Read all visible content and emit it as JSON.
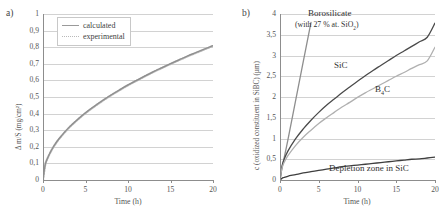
{
  "figure": {
    "panel_a_tag": "a)",
    "panel_b_tag": "b)"
  },
  "panel_a": {
    "xlabel": "Time (h)",
    "ylabel": "Δ m/S (mg/cm²)",
    "yticks": [
      "1",
      "0,9",
      "0,8",
      "0,7",
      "0,6",
      "0,5",
      "0,4",
      "0,3",
      "0,2",
      "0,1",
      "0"
    ],
    "xticks": [
      "0",
      "5",
      "10",
      "15",
      "20"
    ],
    "legend": {
      "calculated": "calculated",
      "experimental": "experimental"
    }
  },
  "panel_b": {
    "xlabel": "Time (h)",
    "ylabel": "c (oxidized constituent in SiBC) (µm)",
    "yticks": [
      "4",
      "3,5",
      "3",
      "2,5",
      "2",
      "1,5",
      "1",
      "0,5",
      "0"
    ],
    "xticks": [
      "0",
      "5",
      "10",
      "15",
      "20"
    ],
    "annotations": {
      "borosilicate": "Borosilicate",
      "borosilicate_sub": "(with 27 % at. SiO",
      "borosilicate_sub2": "2",
      "borosilicate_sub_end": ")",
      "sic": "SiC",
      "b4c_pre": "B",
      "b4c_sub": "4",
      "b4c_post": "C",
      "depletion": "Depletion zone in SiC"
    }
  },
  "colors": {
    "calculated": "#8e8e8e",
    "experimental": "#b8b8b8",
    "borosilicate": "#8e8e8e",
    "sic": "#4a4a4a",
    "b4c": "#b0b0b0",
    "depletion": "#3f3f3f",
    "grid": "#d2d2d2",
    "axis": "#8d8d8d"
  },
  "chart_data": [
    {
      "type": "line",
      "panel": "a",
      "title": "",
      "xlabel": "Time (h)",
      "ylabel": "Δ m/S (mg/cm2)",
      "xlim": [
        0,
        20
      ],
      "ylim": [
        0,
        1
      ],
      "grid": true,
      "legend_position": "top-left",
      "xticks": [
        0,
        5,
        10,
        15,
        20
      ],
      "yticks": [
        0,
        0.1,
        0.2,
        0.3,
        0.4,
        0.5,
        0.6,
        0.7,
        0.8,
        0.9,
        1
      ],
      "x": [
        0,
        0.25,
        0.5,
        1,
        1.5,
        2,
        3,
        4,
        5,
        6,
        7,
        8,
        9,
        10,
        11,
        12,
        13,
        14,
        15,
        16,
        17,
        18,
        19,
        20
      ],
      "series": [
        {
          "name": "calculated",
          "style": "solid",
          "values": [
            0,
            0.09,
            0.128,
            0.181,
            0.222,
            0.256,
            0.314,
            0.362,
            0.405,
            0.443,
            0.479,
            0.512,
            0.543,
            0.573,
            0.6,
            0.627,
            0.653,
            0.677,
            0.701,
            0.724,
            0.747,
            0.768,
            0.789,
            0.81
          ]
        },
        {
          "name": "experimental",
          "style": "dotted",
          "values": [
            0,
            0.088,
            0.126,
            0.179,
            0.22,
            0.254,
            0.312,
            0.36,
            0.403,
            0.441,
            0.477,
            0.51,
            0.541,
            0.571,
            0.598,
            0.625,
            0.651,
            0.675,
            0.699,
            0.722,
            0.745,
            0.766,
            0.787,
            0.808
          ]
        }
      ]
    },
    {
      "type": "line",
      "panel": "b",
      "title": "",
      "xlabel": "Time (h)",
      "ylabel": "c (oxidized constituent in SiBC) (µm)",
      "xlim": [
        0,
        20
      ],
      "ylim": [
        0,
        4
      ],
      "grid": true,
      "legend_position": "inline-annotations",
      "xticks": [
        0,
        5,
        10,
        15,
        20
      ],
      "yticks": [
        0,
        0.5,
        1,
        1.5,
        2,
        2.5,
        3,
        3.5,
        4
      ],
      "x": [
        0,
        0.25,
        0.5,
        1,
        2,
        3,
        4,
        5,
        6,
        7,
        8,
        9,
        10,
        11,
        12,
        13,
        14,
        15,
        16,
        17,
        18,
        19,
        20
      ],
      "series": [
        {
          "name": "Borosilicate (with 27 % at. SiO2)",
          "style": "solid",
          "values": [
            0,
            0.28,
            0.5,
            0.95,
            1.9,
            2.85,
            3.8,
            null,
            null,
            null,
            null,
            null,
            null,
            null,
            null,
            null,
            null,
            null,
            null,
            null,
            null,
            null,
            null
          ]
        },
        {
          "name": "SiC",
          "style": "solid",
          "values": [
            0,
            0.33,
            0.48,
            0.69,
            0.99,
            1.23,
            1.44,
            1.63,
            1.8,
            1.95,
            2.1,
            2.24,
            2.38,
            2.51,
            2.64,
            2.76,
            2.88,
            3.0,
            3.11,
            3.22,
            3.33,
            3.44,
            3.78
          ]
        },
        {
          "name": "B4C",
          "style": "solid",
          "values": [
            0,
            0.28,
            0.41,
            0.58,
            0.83,
            1.03,
            1.2,
            1.36,
            1.5,
            1.63,
            1.76,
            1.87,
            1.99,
            2.1,
            2.2,
            2.3,
            2.4,
            2.5,
            2.59,
            2.69,
            2.78,
            2.87,
            3.2
          ]
        },
        {
          "name": "Depletion zone in SiC",
          "style": "solid",
          "values": [
            0,
            0.04,
            0.06,
            0.09,
            0.13,
            0.17,
            0.2,
            0.23,
            0.26,
            0.29,
            0.32,
            0.34,
            0.36,
            0.38,
            0.4,
            0.42,
            0.44,
            0.46,
            0.48,
            0.5,
            0.51,
            0.53,
            0.55
          ]
        }
      ]
    }
  ]
}
